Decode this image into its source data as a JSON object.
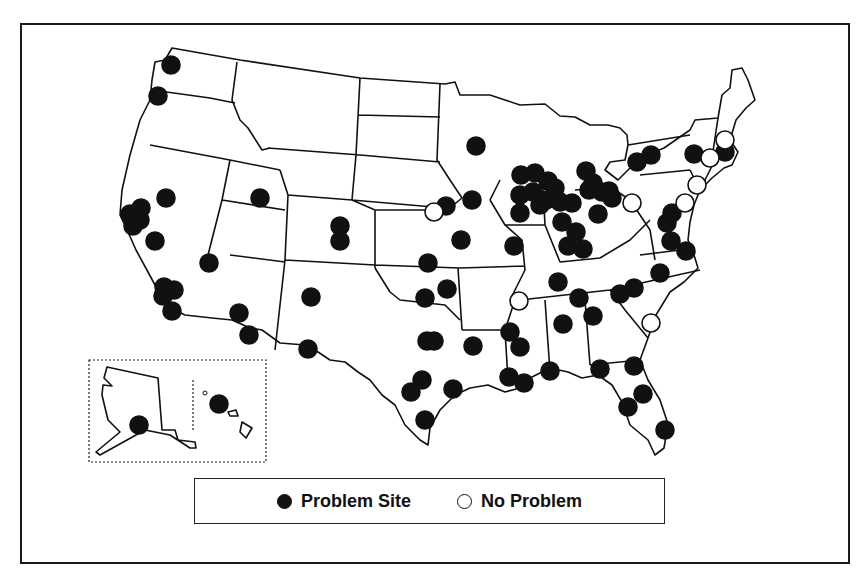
{
  "map": {
    "colors": {
      "problem": "#111111",
      "no_problem": "#ffffff",
      "outline": "#111111"
    },
    "legend": {
      "items": [
        {
          "label": "Problem Site",
          "symbol": "filled-circle"
        },
        {
          "label": "No Problem",
          "symbol": "open-circle"
        }
      ]
    },
    "insets": [
      "Alaska",
      "Hawaii"
    ],
    "sites": {
      "problem": [
        [
          171,
          65
        ],
        [
          158,
          96
        ],
        [
          166,
          198
        ],
        [
          130,
          214
        ],
        [
          141,
          208
        ],
        [
          140,
          220
        ],
        [
          133,
          226
        ],
        [
          155,
          241
        ],
        [
          209,
          263
        ],
        [
          164,
          287
        ],
        [
          174,
          290
        ],
        [
          163,
          296
        ],
        [
          172,
          311
        ],
        [
          239,
          313
        ],
        [
          249,
          335
        ],
        [
          260,
          198
        ],
        [
          340,
          226
        ],
        [
          340,
          241
        ],
        [
          311,
          297
        ],
        [
          308,
          349
        ],
        [
          476,
          146
        ],
        [
          446,
          206
        ],
        [
          472,
          200
        ],
        [
          461,
          240
        ],
        [
          428,
          263
        ],
        [
          425,
          298
        ],
        [
          447,
          289
        ],
        [
          427,
          341
        ],
        [
          434,
          341
        ],
        [
          473,
          346
        ],
        [
          422,
          380
        ],
        [
          411,
          392
        ],
        [
          425,
          420
        ],
        [
          453,
          389
        ],
        [
          510,
          332
        ],
        [
          520,
          347
        ],
        [
          509,
          377
        ],
        [
          524,
          383
        ],
        [
          550,
          371
        ],
        [
          521,
          175
        ],
        [
          535,
          173
        ],
        [
          548,
          181
        ],
        [
          520,
          195
        ],
        [
          533,
          192
        ],
        [
          546,
          200
        ],
        [
          555,
          188
        ],
        [
          520,
          213
        ],
        [
          540,
          205
        ],
        [
          560,
          202
        ],
        [
          586,
          171
        ],
        [
          593,
          183
        ],
        [
          589,
          190
        ],
        [
          602,
          192
        ],
        [
          609,
          191
        ],
        [
          612,
          198
        ],
        [
          572,
          203
        ],
        [
          562,
          222
        ],
        [
          598,
          214
        ],
        [
          576,
          232
        ],
        [
          568,
          246
        ],
        [
          583,
          249
        ],
        [
          514,
          246
        ],
        [
          558,
          282
        ],
        [
          579,
          298
        ],
        [
          563,
          324
        ],
        [
          593,
          316
        ],
        [
          620,
          294
        ],
        [
          634,
          288
        ],
        [
          660,
          273
        ],
        [
          672,
          213
        ],
        [
          667,
          223
        ],
        [
          671,
          241
        ],
        [
          686,
          251
        ],
        [
          637,
          162
        ],
        [
          651,
          155
        ],
        [
          694,
          154
        ],
        [
          725,
          152
        ],
        [
          600,
          369
        ],
        [
          634,
          366
        ],
        [
          628,
          407
        ],
        [
          643,
          394
        ],
        [
          665,
          430
        ],
        [
          139,
          425
        ],
        [
          219,
          404
        ]
      ],
      "no_problem": [
        [
          434,
          212
        ],
        [
          519,
          301
        ],
        [
          632,
          203
        ],
        [
          651,
          323
        ],
        [
          685,
          203
        ],
        [
          697,
          185
        ],
        [
          710,
          158
        ],
        [
          725,
          140
        ]
      ]
    }
  }
}
